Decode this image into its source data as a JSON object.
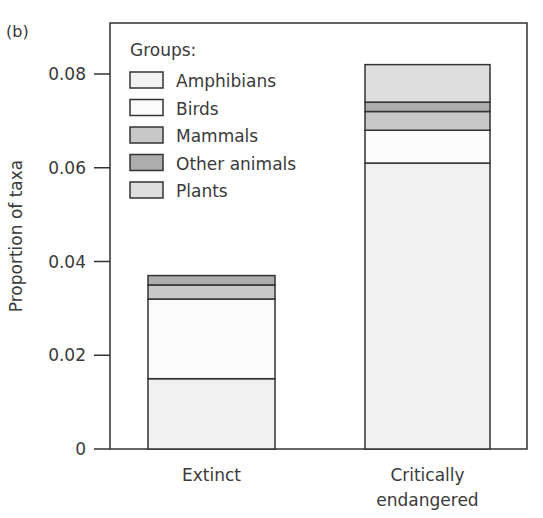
{
  "chart_data": {
    "type": "bar",
    "stacked": true,
    "panel_label": "(b)",
    "title": "",
    "xlabel": "",
    "ylabel": "Proportion of taxa",
    "ylim": [
      0,
      0.08
    ],
    "yticks": [
      0,
      0.02,
      0.04,
      0.06,
      0.08
    ],
    "ytick_labels": [
      "0",
      "0.02",
      "0.04",
      "0.06",
      "0.08"
    ],
    "categories": [
      "Extinct",
      "Critically endangered"
    ],
    "category_labels": [
      [
        "Extinct"
      ],
      [
        "Critically",
        "endangered"
      ]
    ],
    "legend": {
      "title": "Groups:",
      "placement": "top-left"
    },
    "series": [
      {
        "name": "Amphibians",
        "color": "#f1f1f1",
        "values": [
          0.015,
          0.061
        ]
      },
      {
        "name": "Birds",
        "color": "#fbfbfb",
        "values": [
          0.017,
          0.007
        ]
      },
      {
        "name": "Mammals",
        "color": "#c8c8c8",
        "values": [
          0.003,
          0.004
        ]
      },
      {
        "name": "Other animals",
        "color": "#adadad",
        "values": [
          0.002,
          0.002
        ]
      },
      {
        "name": "Plants",
        "color": "#dedede",
        "values": [
          0,
          0.008
        ]
      }
    ],
    "grid": false
  }
}
